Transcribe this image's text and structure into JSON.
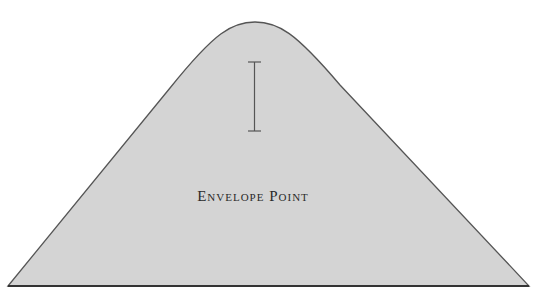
{
  "shape": {
    "type": "envelope-curve",
    "fill_color": "#d4d4d4",
    "stroke_color": "#555555",
    "peak": {
      "x": 255,
      "y": 22
    },
    "base_left": {
      "x": 8,
      "y": 286
    },
    "base_right": {
      "x": 529,
      "y": 286
    }
  },
  "label": {
    "text": "Envelope Point"
  },
  "cursor": {
    "type": "i-beam-icon",
    "x": 254,
    "top_y": 62,
    "bottom_y": 131
  }
}
